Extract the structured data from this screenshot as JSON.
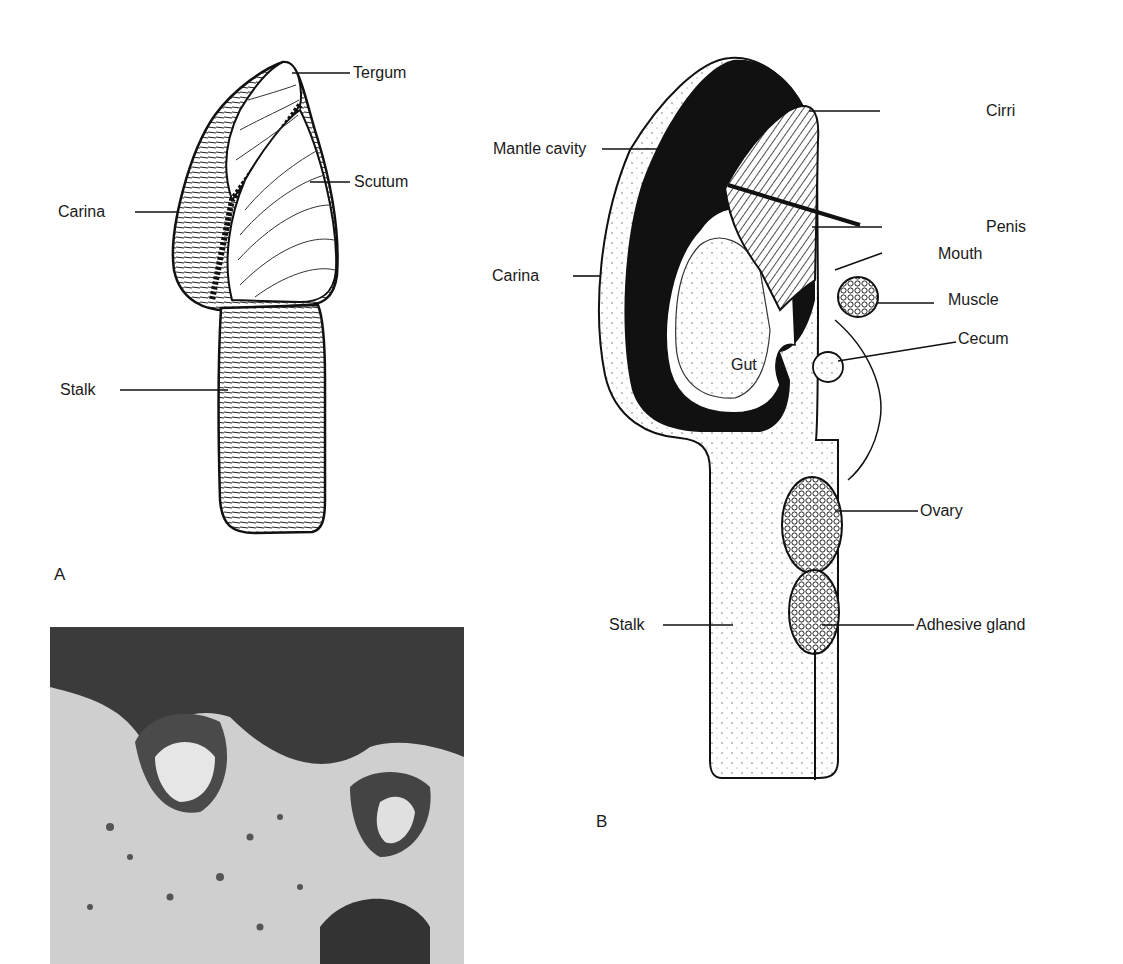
{
  "figure": {
    "panel_a": {
      "letter": "A",
      "title": "External view of goose barnacle",
      "labels": {
        "tergum": "Tergum",
        "scutum": "Scutum",
        "carina": "Carina",
        "stalk": "Stalk"
      }
    },
    "panel_b": {
      "letter": "B",
      "title": "Internal section of goose barnacle",
      "labels": {
        "cirri": "Cirri",
        "mantle_cavity": "Mantle cavity",
        "penis": "Penis",
        "mouth": "Mouth",
        "carina": "Carina",
        "muscle": "Muscle",
        "cecum": "Cecum",
        "gut": "Gut",
        "ovary": "Ovary",
        "stalk": "Stalk",
        "adhesive_gland": "Adhesive gland"
      }
    },
    "photo": {
      "description": "Photograph of barnacles on rock surface"
    }
  },
  "colors": {
    "ink": "#1a1a1a",
    "paper": "#ffffff",
    "photo_dark": "#3b3b3b",
    "photo_light": "#d9d9d9"
  }
}
